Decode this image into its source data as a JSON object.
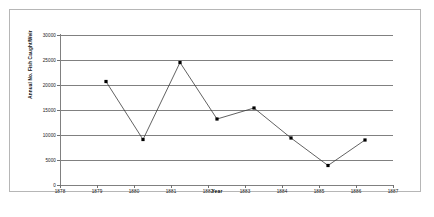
{
  "chart_data": {
    "type": "line",
    "title": "",
    "xlabel": "Year",
    "ylabel": "Annual No. Fish Caught/Weir",
    "x": [
      1879,
      1880,
      1881,
      1882,
      1883,
      1884,
      1885,
      1886
    ],
    "values": [
      22500,
      10900,
      26300,
      15000,
      17200,
      11200,
      5700,
      10800
    ],
    "series": [
      {
        "name": "Annual No. Fish Caught/Weir",
        "x": [
          1879,
          1880,
          1881,
          1882,
          1883,
          1884,
          1885,
          1886
        ],
        "values": [
          22500,
          10900,
          26300,
          15000,
          17200,
          11200,
          5700,
          10800
        ]
      }
    ],
    "xlim": [
      1878,
      1887
    ],
    "ylim": [
      0,
      30000
    ],
    "ytick_labels": [
      "0",
      "5000",
      "10000",
      "15000",
      "20000",
      "25000",
      "30000"
    ],
    "ytick_values": [
      0,
      5000,
      10000,
      15000,
      20000,
      25000,
      30000
    ],
    "xtick_labels": [
      "1878",
      "1879",
      "1880",
      "1881",
      "1882",
      "1883",
      "1884",
      "1885",
      "1886",
      "1887"
    ],
    "xtick_values": [
      1878,
      1879,
      1880,
      1881,
      1882,
      1883,
      1884,
      1885,
      1886,
      1887
    ],
    "grid": "horizontal",
    "legend": "none",
    "marker": "square",
    "line_color": "#3a3a3a",
    "marker_color": "#000000",
    "grid_color": "#808080",
    "frame_color": "#b6b6b6",
    "background": "#ffffff"
  }
}
